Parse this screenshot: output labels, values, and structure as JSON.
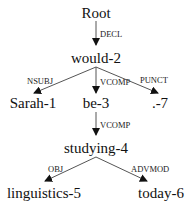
{
  "diagram": {
    "type": "dependency-tree",
    "nodes": [
      {
        "id": "root",
        "label": "Root"
      },
      {
        "id": "n2",
        "label": "would-2"
      },
      {
        "id": "n1",
        "label": "Sarah-1"
      },
      {
        "id": "n3",
        "label": "be-3"
      },
      {
        "id": "n7",
        "label": ".-7"
      },
      {
        "id": "n4",
        "label": "studying-4"
      },
      {
        "id": "n5",
        "label": "linguistics-5"
      },
      {
        "id": "n6",
        "label": "today-6"
      }
    ],
    "edges": [
      {
        "from": "root",
        "to": "n2",
        "label": "DECL"
      },
      {
        "from": "n2",
        "to": "n1",
        "label": "NSUBJ"
      },
      {
        "from": "n2",
        "to": "n3",
        "label": "VCOMP"
      },
      {
        "from": "n2",
        "to": "n7",
        "label": "PUNCT"
      },
      {
        "from": "n3",
        "to": "n4",
        "label": "VCOMP"
      },
      {
        "from": "n4",
        "to": "n5",
        "label": "OBJ"
      },
      {
        "from": "n4",
        "to": "n6",
        "label": "ADVMOD"
      }
    ]
  }
}
